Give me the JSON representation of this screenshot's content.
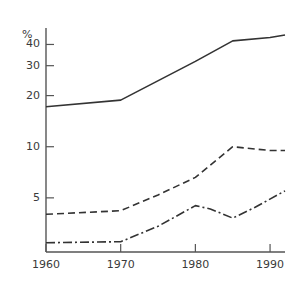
{
  "chart_data": {
    "type": "line",
    "title": "",
    "subtitle": "",
    "xlabel": "",
    "ylabel": "%",
    "y_unit_label": "%",
    "yscale": "log",
    "ylim": [
      2.4,
      50
    ],
    "xlim": [
      1960,
      1992
    ],
    "grid": false,
    "legend": "none",
    "yticks": [
      5,
      10,
      20,
      30,
      40
    ],
    "ytick_labels": [
      "5",
      "10",
      "20",
      "30",
      "40"
    ],
    "xticks": [
      1960,
      1970,
      1980,
      1990
    ],
    "xtick_labels": [
      "1960",
      "1970",
      "1980",
      "1990"
    ],
    "series": [
      {
        "name": "series-1-solid",
        "style": "solid",
        "color": "#333333",
        "x": [
          1960,
          1970,
          1980,
          1985,
          1990,
          1992
        ],
        "values": [
          17.2,
          18.8,
          31.8,
          42.0,
          44.0,
          45.5
        ]
      },
      {
        "name": "series-2-dashed",
        "style": "dashed",
        "color": "#333333",
        "x": [
          1960,
          1970,
          1975,
          1980,
          1985,
          1990,
          1992
        ],
        "values": [
          4.0,
          4.2,
          5.2,
          6.6,
          10.0,
          9.5,
          9.5
        ]
      },
      {
        "name": "series-3-dash-dot",
        "style": "dashdot",
        "color": "#333333",
        "x": [
          1960,
          1970,
          1975,
          1980,
          1982,
          1985,
          1988,
          1992
        ],
        "values": [
          2.72,
          2.76,
          3.4,
          4.5,
          4.3,
          3.8,
          4.4,
          5.5
        ]
      }
    ]
  },
  "axis": {
    "unit": "%",
    "ytick_labels": [
      "40",
      "30",
      "20",
      "10",
      "5"
    ],
    "xtick_labels": [
      "1960",
      "1970",
      "1980",
      "1990"
    ]
  },
  "colors": {
    "line": "#333333",
    "axis": "#555555",
    "text": "#3a3a3a",
    "background": "#ffffff"
  }
}
